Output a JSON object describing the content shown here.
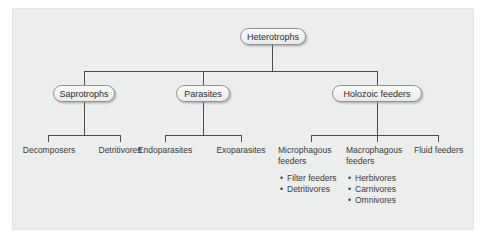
{
  "diagram": {
    "colors": {
      "panel_background": "#eceded",
      "page_background": "#ffffff",
      "connector": "#4c4c4c",
      "node_fill": "#f4f4f4",
      "node_border": "#8f9192",
      "text": "#3a3a3a"
    },
    "root": {
      "label": "Heterotrophs"
    },
    "level2": [
      {
        "label": "Saprotrophs"
      },
      {
        "label": "Parasites"
      },
      {
        "label": "Holozoic feeders"
      }
    ],
    "leaves": [
      {
        "label": "Decomposers"
      },
      {
        "label": "Detritivores"
      },
      {
        "label": "Endoparasites"
      },
      {
        "label": "Exoparasites"
      },
      {
        "label": "Microphagous\nfeeders"
      },
      {
        "label": "Macrophagous\nfeeders"
      },
      {
        "label": "Fluid feeders"
      }
    ],
    "sublists": [
      {
        "parent": "Microphagous feeders",
        "items": [
          "Filter feeders",
          "Detritivores"
        ]
      },
      {
        "parent": "Macrophagous feeders",
        "items": [
          "Herbivores",
          "Carnivores",
          "Omnivores"
        ]
      }
    ]
  }
}
